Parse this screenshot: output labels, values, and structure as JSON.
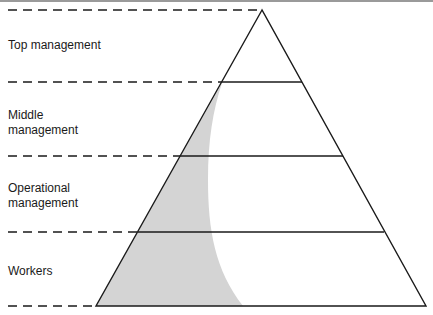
{
  "diagram": {
    "type": "pyramid",
    "levels": [
      {
        "label_line1": "Top management",
        "label_line2": ""
      },
      {
        "label_line1": "Middle",
        "label_line2": "management"
      },
      {
        "label_line1": "Operational",
        "label_line2": "management"
      },
      {
        "label_line1": "Workers",
        "label_line2": ""
      }
    ],
    "colors": {
      "line": "#1a1a1a",
      "shade": "#d4d4d4",
      "background": "#ffffff"
    }
  }
}
